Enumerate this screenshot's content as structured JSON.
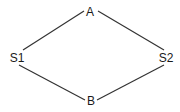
{
  "diagram": {
    "type": "graph",
    "colors": {
      "line": "#333333",
      "text": "#1a1a1a",
      "background": "#ffffff"
    },
    "nodes": [
      {
        "id": "A",
        "label": "A",
        "x": 90,
        "y": 12
      },
      {
        "id": "S1",
        "label": "S1",
        "x": 17,
        "y": 58
      },
      {
        "id": "S2",
        "label": "S2",
        "x": 166,
        "y": 58
      },
      {
        "id": "B",
        "label": "B",
        "x": 91,
        "y": 101
      }
    ],
    "edges": [
      {
        "from": "A",
        "to": "S1",
        "x1": 84,
        "y1": 11,
        "x2": 23,
        "y2": 50
      },
      {
        "from": "A",
        "to": "S2",
        "x1": 98,
        "y1": 11,
        "x2": 164,
        "y2": 50
      },
      {
        "from": "S1",
        "to": "B",
        "x1": 19,
        "y1": 65,
        "x2": 85,
        "y2": 100
      },
      {
        "from": "S2",
        "to": "B",
        "x1": 164,
        "y1": 65,
        "x2": 97,
        "y2": 100
      }
    ]
  }
}
